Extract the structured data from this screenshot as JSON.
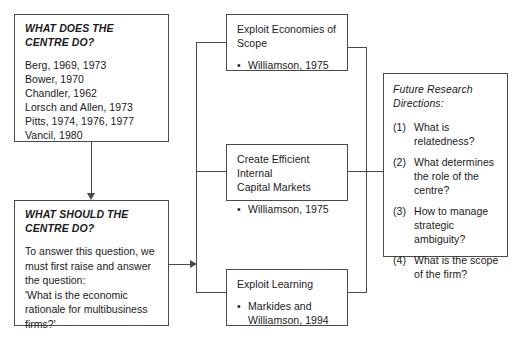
{
  "diagram": {
    "type": "flowchart",
    "boxes": {
      "what_does_centre_do": {
        "heading": "WHAT DOES THE\nCENTRE DO?",
        "references": "Berg, 1969, 1973\nBower, 1970\nChandler, 1962\nLorsch and Allen, 1973\nPitts, 1974, 1976, 1977\nVancil, 1980"
      },
      "what_should_centre_do": {
        "heading": "WHAT SHOULD THE\nCENTRE DO?",
        "body": "To answer this question, we\nmust first raise and answer\nthe question:\n'What is the economic\nrationale for multibusiness\nfirms?'"
      },
      "exploit_economies_of_scope": {
        "title": "Exploit Economies of\nScope",
        "bullets": [
          "Williamson, 1975"
        ]
      },
      "create_efficient_internal_capital_markets": {
        "title": "Create Efficient Internal\nCapital Markets",
        "bullets": [
          "Williamson, 1975"
        ]
      },
      "exploit_learning": {
        "title": "Exploit Learning",
        "bullets": [
          "Markides and\nWilliamson, 1994"
        ]
      },
      "future_research_directions": {
        "heading": "Future Research\nDirections:",
        "items": [
          {
            "number": "(1)",
            "text": "What is\nrelatedness?"
          },
          {
            "number": "(2)",
            "text": "What determines\nthe role of the\ncentre?"
          },
          {
            "number": "(3)",
            "text": "How to manage\nstrategic\nambiguity?"
          },
          {
            "number": "(4)",
            "text": "What is the scope\nof the firm?"
          }
        ]
      }
    },
    "bullet_glyph": "•",
    "stroke_color": "#4a4a4a",
    "background_color": "#ffffff"
  }
}
